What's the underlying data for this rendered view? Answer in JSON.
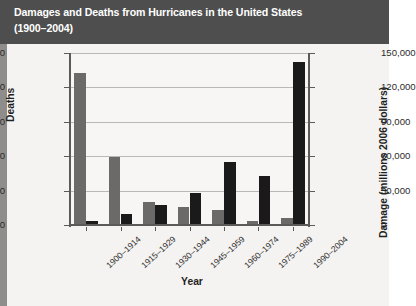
{
  "title": {
    "line1": "Damages and Deaths from Hurricanes in the United States",
    "line2": "(1900–2004)"
  },
  "chart_data": {
    "type": "bar",
    "title": "Damages and Deaths from Hurricanes in the United States (1900–2004)",
    "xlabel": "Year",
    "categories": [
      "1900–1914",
      "1915–1929",
      "1930–1944",
      "1945–1959",
      "1960–1974",
      "1975–1989",
      "1990–2004"
    ],
    "series": [
      {
        "name": "Deaths",
        "axis": "left",
        "color": "#6b6a68",
        "unit": "deaths",
        "values": [
          8800,
          3900,
          1300,
          1000,
          800,
          200,
          350
        ]
      },
      {
        "name": "Damage",
        "axis": "right",
        "color": "#1a1a1a",
        "unit": "millions 2006 dollars",
        "values": [
          3000,
          9000,
          17000,
          27000,
          54000,
          42000,
          141000
        ]
      }
    ],
    "left_axis": {
      "label": "Deaths",
      "ticks": [
        0,
        2000,
        4000,
        6000,
        8000,
        10000
      ],
      "tick_labels": [
        "0",
        "2,000",
        "4,000",
        "6,000",
        "8,000",
        "10,000"
      ],
      "ylim": [
        0,
        10000
      ]
    },
    "right_axis": {
      "label": "Damage (millions 2006 dollars)",
      "ticks": [
        0,
        30000,
        60000,
        90000,
        120000,
        150000
      ],
      "tick_labels": [
        "0",
        "30,000",
        "60,000",
        "90,000",
        "120,000",
        "150,000"
      ],
      "ylim": [
        0,
        150000
      ]
    },
    "grid": true,
    "legend": null
  }
}
